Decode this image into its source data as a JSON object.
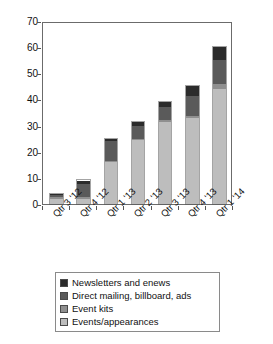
{
  "chart_data": {
    "type": "bar",
    "stacked": true,
    "title": "",
    "subtitle": "",
    "xlabel": "",
    "ylabel": "",
    "ylim": [
      0,
      70
    ],
    "yticks": [
      0,
      10,
      20,
      30,
      40,
      50,
      60,
      70
    ],
    "ytick_labels": [
      "0",
      "10",
      "20",
      "30",
      "40",
      "50",
      "60",
      "70"
    ],
    "grid": false,
    "legend_position": "bottom",
    "x_label_rotation": -45,
    "categories": [
      "Qtr 3 '12",
      "Qtr 4 '12",
      "Qtr 1 '13",
      "Qtr 2 '13",
      "Qtr 3 '13",
      "Qtr 4 '13",
      "Qtr 1 '14"
    ],
    "series": [
      {
        "name": "Events/appearances",
        "color": "#bdbdbd",
        "values": [
          2,
          2,
          16,
          24.5,
          31.5,
          33,
          44
        ]
      },
      {
        "name": "Event kits",
        "color": "#8f8f8f",
        "values": [
          0.5,
          0.5,
          0.5,
          0.5,
          0.5,
          0.5,
          2
        ]
      },
      {
        "name": "Direct mailing, billboard, ads",
        "color": "#5a5a5a",
        "values": [
          1,
          5,
          7.5,
          5,
          5,
          8,
          9
        ]
      },
      {
        "name": "Newsletters and enews",
        "color": "#2b2b2b",
        "values": [
          0.5,
          1.5,
          1,
          1.5,
          2,
          3.5,
          5
        ]
      }
    ],
    "totals": [
      4,
      9,
      25,
      31.5,
      39,
      45,
      60
    ],
    "legend": [
      {
        "label": "Newsletters and enews",
        "color": "#2b2b2b"
      },
      {
        "label": "Direct mailing, billboard, ads",
        "color": "#5a5a5a"
      },
      {
        "label": "Event kits",
        "color": "#8f8f8f"
      },
      {
        "label": "Events/appearances",
        "color": "#bdbdbd"
      }
    ]
  }
}
